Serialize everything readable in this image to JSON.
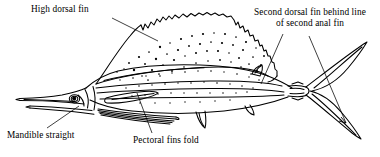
{
  "figure": {
    "background_color": "#ffffff",
    "ink_color": "#000000",
    "width": 380,
    "height": 157
  },
  "labels": {
    "high_dorsal_fin": "High dorsal fin",
    "second_dorsal_line1": "Second dorsal fin behind line",
    "second_dorsal_line2": "of second anal fin",
    "mandible_straight": "Mandible straight",
    "pectoral_fins_fold": "Pectoral fins fold"
  },
  "leaders": [
    {
      "name": "leader-high-dorsal-fin",
      "from": [
        112,
        18
      ],
      "to": [
        158,
        41
      ]
    },
    {
      "name": "leader-second-dorsal-a",
      "from": [
        283,
        34
      ],
      "to": [
        262,
        86
      ]
    },
    {
      "name": "leader-second-dorsal-b",
      "from": [
        308,
        36
      ],
      "to": [
        345,
        122
      ]
    },
    {
      "name": "leader-mandible-straight",
      "from": [
        47,
        128
      ],
      "to": [
        78,
        106
      ]
    },
    {
      "name": "leader-pectoral-fins-fold",
      "from": [
        152,
        133
      ],
      "to": [
        137,
        94
      ]
    }
  ],
  "anatomy": [
    {
      "name": "rostrum-bill",
      "description": "long pointed upper bill"
    },
    {
      "name": "mandible",
      "description": "straight lower jaw"
    },
    {
      "name": "eye",
      "description": "small round eye on head"
    },
    {
      "name": "first-dorsal-sail",
      "description": "tall sail-like dorsal fin with scalloped edge and stipple spots"
    },
    {
      "name": "second-dorsal-fin",
      "description": "small fin near tail"
    },
    {
      "name": "pectoral-fin",
      "description": "fin folded against body"
    },
    {
      "name": "pelvic-fins",
      "description": "long trailing ray fins"
    },
    {
      "name": "anal-fins",
      "description": "two fins on underside"
    },
    {
      "name": "caudal-fin",
      "description": "deeply forked tail"
    },
    {
      "name": "lateral-line",
      "description": "line along flank"
    }
  ]
}
